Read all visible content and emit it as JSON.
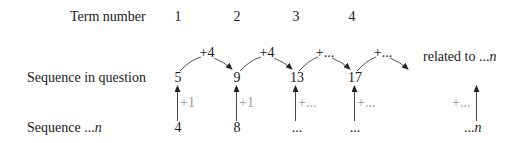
{
  "rows": {
    "term_number": {
      "label": "Term number",
      "values": [
        "1",
        "2",
        "3",
        "4"
      ]
    },
    "sequence_in_question": {
      "label": "Sequence in question",
      "values": [
        "5",
        "9",
        "13",
        "17"
      ]
    },
    "sequence_n": {
      "label_prefix": "Sequence ...",
      "label_var": "n",
      "values": [
        "4",
        "8",
        "...",
        "..."
      ],
      "last_prefix": "...",
      "last_var": "n"
    }
  },
  "differences": [
    "+4",
    "+4",
    "+...",
    "+..."
  ],
  "related_label": {
    "prefix": "related to ...",
    "var": "n"
  },
  "vertical_labels": [
    "+1",
    "+1",
    "+...",
    "+...",
    "+..."
  ],
  "colors": {
    "text": "#1a1a1a",
    "gray": "#9a9a9a",
    "line": "#333333"
  }
}
